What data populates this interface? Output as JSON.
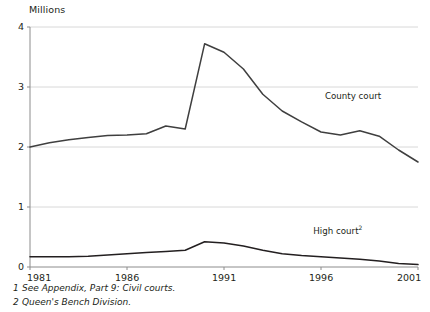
{
  "chart_data": {
    "type": "line",
    "title": "",
    "ylabel": "Millions",
    "xlabel": "",
    "ylim": [
      0,
      4
    ],
    "xlim": [
      1981,
      2001
    ],
    "yticks": [
      "0",
      "1",
      "2",
      "3",
      "4"
    ],
    "ytick_values": [
      0,
      1,
      2,
      3,
      4
    ],
    "xticks": [
      "1981",
      "1986",
      "1991",
      "1996",
      "2001"
    ],
    "xtick_values": [
      1981,
      1986,
      1991,
      1996,
      2001
    ],
    "grid": "horizontal",
    "legend_position": "inline-labels",
    "x": [
      1981,
      1982,
      1983,
      1984,
      1985,
      1986,
      1987,
      1988,
      1989,
      1990,
      1991,
      1992,
      1993,
      1994,
      1995,
      1996,
      1997,
      1998,
      1999,
      2000,
      2001
    ],
    "series": [
      {
        "name": "County court",
        "label": "County court",
        "label_sup": "",
        "color": "#3f3f3f",
        "values": [
          2.0,
          2.07,
          2.12,
          2.16,
          2.19,
          2.2,
          2.22,
          2.35,
          2.3,
          3.72,
          3.58,
          3.3,
          2.88,
          2.6,
          2.42,
          2.25,
          2.2,
          2.27,
          2.18,
          1.95,
          1.75
        ]
      },
      {
        "name": "High court",
        "label": "High court",
        "label_sup": "2",
        "color": "#231f20",
        "values": [
          0.17,
          0.17,
          0.17,
          0.18,
          0.2,
          0.22,
          0.24,
          0.26,
          0.28,
          0.42,
          0.4,
          0.35,
          0.28,
          0.22,
          0.19,
          0.17,
          0.15,
          0.13,
          0.1,
          0.06,
          0.04
        ]
      }
    ],
    "annotations": [
      {
        "text": "County court",
        "x": 1996.2,
        "y": 2.83
      },
      {
        "text": "High court",
        "sup": "2",
        "x": 1995.6,
        "y": 0.58
      }
    ]
  },
  "footnotes": [
    {
      "number": "1",
      "text": "See Appendix, Part 9: Civil courts."
    },
    {
      "number": "2",
      "text": "Queen's Bench Division."
    }
  ],
  "colors": {
    "grid": "#d8d8d8",
    "axis": "#8c8c8c",
    "county_line": "#3f3f3f",
    "high_line": "#231f20",
    "text": "#231f20"
  }
}
